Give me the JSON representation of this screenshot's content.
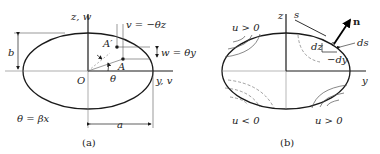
{
  "figure_a": {
    "caption": "(a)",
    "labels": {
      "z_axis": "z, w",
      "y_axis": "y, v",
      "origin": "O",
      "b": "b",
      "a": "a",
      "A_prime": "A′",
      "A": "A",
      "theta": "θ",
      "v_eq": "v = −θz",
      "w_eq": "w = θy",
      "theta_eq": "θ = βx"
    }
  },
  "figure_b": {
    "caption": "(b)",
    "labels": {
      "z_axis": "z",
      "y_axis": "y",
      "s": "s",
      "n": "n",
      "dz": "dz",
      "ds": "ds",
      "neg_dy": "−dy",
      "u_pos_top_left": "u > 0",
      "u_neg_bottom_left": "u < 0",
      "u_pos_bottom_right": "u > 0"
    }
  },
  "colors": {
    "stroke": "#1a1a1a",
    "thin": "#555555"
  }
}
